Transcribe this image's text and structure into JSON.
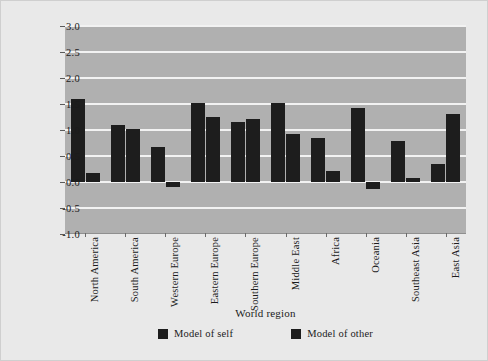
{
  "chart_data": {
    "type": "bar",
    "title": "",
    "xlabel": "World region",
    "ylabel": "Internal working models",
    "categories": [
      "North America",
      "South America",
      "Western Europe",
      "Eastern Europe",
      "Southern Europe",
      "Middle East",
      "Africa",
      "Oceania",
      "Southeast Asia",
      "East Asia"
    ],
    "series": [
      {
        "name": "Model of self",
        "values": [
          1.6,
          1.1,
          0.67,
          1.52,
          1.15,
          1.52,
          0.85,
          1.42,
          0.78,
          0.35
        ]
      },
      {
        "name": "Model of other",
        "values": [
          0.18,
          1.02,
          -0.1,
          1.25,
          1.22,
          0.92,
          0.22,
          -0.13,
          0.07,
          1.3
        ]
      }
    ],
    "ylim": [
      -1.0,
      3.0
    ],
    "yticks": [
      "3.0",
      "2.5",
      "2.0",
      "1.5",
      "1.0",
      "0.5",
      "0.0",
      "-0.5",
      "-1.0"
    ],
    "ytick_values": [
      3.0,
      2.5,
      2.0,
      1.5,
      1.0,
      0.5,
      0.0,
      -0.5,
      -1.0
    ],
    "grid": true,
    "legend_position": "bottom-center",
    "colors": {
      "bar": "#1d1d1d",
      "plot_background": "#b0b0b0",
      "figure_background": "#e9e9e9",
      "gridline": "#f2f2f2"
    }
  }
}
